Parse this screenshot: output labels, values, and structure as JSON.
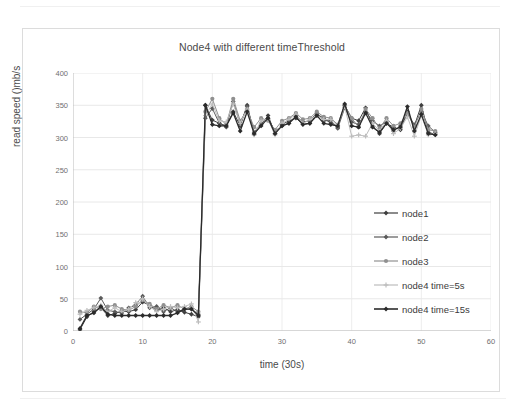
{
  "chart_data": {
    "type": "line",
    "title": "Node4 with different timeThreshold",
    "xlabel": "time (30s)",
    "ylabel": "read speed ()mb/s",
    "xlim": [
      0,
      60
    ],
    "ylim": [
      0,
      400
    ],
    "xticks": [
      0,
      10,
      20,
      30,
      40,
      50,
      60
    ],
    "yticks": [
      0,
      50,
      100,
      150,
      200,
      250,
      300,
      350,
      400
    ],
    "grid": true,
    "legend_position": "center-right",
    "x": [
      1,
      2,
      3,
      4,
      5,
      6,
      7,
      8,
      9,
      10,
      11,
      12,
      13,
      14,
      15,
      16,
      17,
      18,
      19,
      20,
      21,
      22,
      23,
      24,
      25,
      26,
      27,
      28,
      29,
      30,
      31,
      32,
      33,
      34,
      35,
      36,
      37,
      38,
      39,
      40,
      41,
      42,
      43,
      44,
      45,
      46,
      47,
      48,
      49,
      50,
      51,
      52
    ],
    "series": [
      {
        "name": "node1",
        "color": "#3f3f3f",
        "marker": "diamond",
        "values": [
          2,
          22,
          30,
          36,
          24,
          27,
          31,
          30,
          33,
          45,
          40,
          32,
          36,
          30,
          33,
          29,
          26,
          22,
          350,
          327,
          322,
          318,
          340,
          318,
          350,
          305,
          320,
          334,
          306,
          320,
          326,
          330,
          321,
          322,
          336,
          330,
          322,
          316,
          350,
          330,
          326,
          346,
          318,
          306,
          322,
          316,
          312,
          340,
          318,
          350,
          308,
          305
        ]
      },
      {
        "name": "node2",
        "color": "#5a5a5a",
        "marker": "diamond",
        "values": [
          18,
          26,
          34,
          51,
          32,
          30,
          28,
          36,
          40,
          54,
          36,
          38,
          30,
          36,
          30,
          34,
          34,
          26,
          330,
          345,
          322,
          316,
          356,
          320,
          348,
          308,
          322,
          330,
          310,
          318,
          322,
          334,
          324,
          326,
          338,
          326,
          326,
          314,
          346,
          324,
          320,
          340,
          326,
          318,
          324,
          310,
          318,
          336,
          320,
          340,
          318,
          308
        ]
      },
      {
        "name": "node3",
        "color": "#909090",
        "marker": "circle",
        "values": [
          30,
          28,
          38,
          34,
          38,
          40,
          34,
          32,
          38,
          48,
          42,
          34,
          40,
          36,
          40,
          34,
          38,
          30,
          340,
          360,
          330,
          320,
          360,
          326,
          342,
          316,
          330,
          326,
          312,
          326,
          330,
          338,
          328,
          330,
          340,
          332,
          330,
          320,
          350,
          330,
          316,
          344,
          330,
          314,
          330,
          318,
          322,
          338,
          316,
          344,
          312,
          310
        ]
      },
      {
        "name": "node4 time=5s",
        "color": "#bdbdbd",
        "marker": "plus",
        "values": [
          26,
          32,
          36,
          40,
          30,
          36,
          30,
          34,
          44,
          50,
          38,
          30,
          34,
          38,
          36,
          38,
          42,
          14,
          334,
          352,
          326,
          324,
          352,
          322,
          344,
          304,
          326,
          328,
          304,
          322,
          328,
          336,
          322,
          328,
          334,
          328,
          328,
          318,
          348,
          302,
          304,
          302,
          322,
          310,
          326,
          306,
          314,
          332,
          302,
          334,
          304,
          306
        ]
      },
      {
        "name": "node4 time=15s",
        "color": "#2b2b2b",
        "marker": "diamond",
        "values": [
          4,
          24,
          28,
          38,
          26,
          24,
          24,
          24,
          24,
          24,
          24,
          24,
          24,
          24,
          28,
          34,
          34,
          24,
          350,
          320,
          318,
          318,
          338,
          310,
          340,
          306,
          318,
          330,
          306,
          318,
          322,
          332,
          320,
          322,
          334,
          322,
          320,
          318,
          352,
          318,
          316,
          338,
          316,
          308,
          322,
          312,
          316,
          348,
          310,
          336,
          306,
          304
        ]
      }
    ]
  },
  "legend": {
    "items": [
      {
        "label": "node1"
      },
      {
        "label": "node2"
      },
      {
        "label": "node3"
      },
      {
        "label": "node4 time=5s"
      },
      {
        "label": "node4 time=15s"
      }
    ]
  }
}
